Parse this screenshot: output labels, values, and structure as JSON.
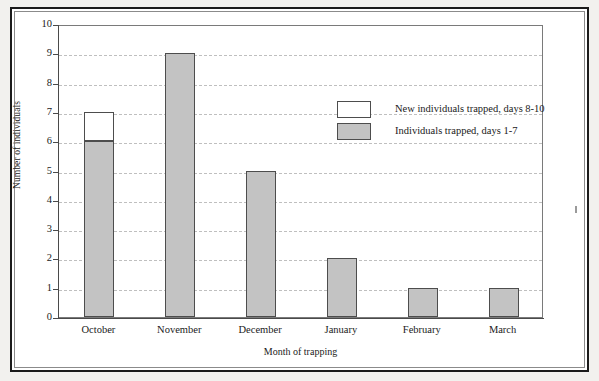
{
  "figure": {
    "background_color": "#ffffff",
    "frame_color": "#1b1b1b",
    "bar_fill_color": "#c3c3c3",
    "bar_new_color": "#ffffff",
    "bar_edge_color": "#4d4d4d",
    "gridline_color": "#bfbfbf"
  },
  "chart_data": {
    "type": "bar",
    "stacked": true,
    "title": "",
    "xlabel": "Month of trapping",
    "ylabel": "Number of individuals",
    "categories": [
      "October",
      "November",
      "December",
      "January",
      "February",
      "March"
    ],
    "series": [
      {
        "name": "Individuals trapped, days 1-7",
        "color": "#c3c3c3",
        "values": [
          6,
          9,
          5,
          2,
          1,
          1
        ]
      },
      {
        "name": "New individuals trapped, days 8-10",
        "color": "#ffffff",
        "values": [
          1,
          0,
          0,
          0,
          0,
          0
        ]
      }
    ],
    "totals": [
      7,
      9,
      5,
      2,
      1,
      1
    ],
    "ylim": [
      0,
      10
    ],
    "ytick_step": 1,
    "yticks": [
      0,
      1,
      2,
      3,
      4,
      5,
      6,
      7,
      8,
      9,
      10
    ],
    "ytick_labels": [
      "0",
      "1",
      "2",
      "3",
      "4",
      "5",
      "6",
      "7",
      "8",
      "9",
      "10"
    ],
    "grid": "horizontal-dashed",
    "legend_position": "upper-right-inside"
  },
  "legend": {
    "items": [
      {
        "label": "New individuals trapped, days 8-10",
        "swatch": "white"
      },
      {
        "label": "Individuals trapped, days 1-7",
        "swatch": "gray"
      }
    ]
  }
}
